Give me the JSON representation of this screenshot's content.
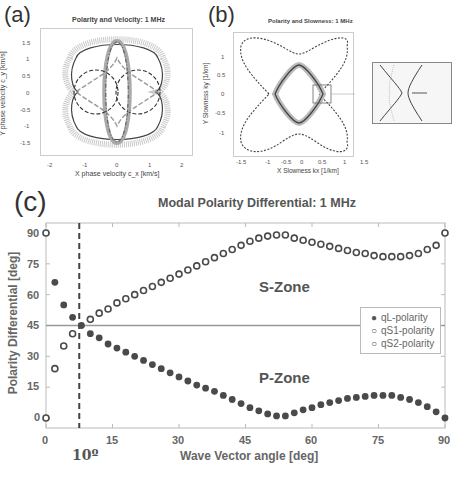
{
  "panel_a": {
    "label": "(a)",
    "title": "Polarity and Velocity: 1 MHz",
    "xlabel": "X phase velocity c_x [km/s]",
    "ylabel": "Y phase velocity c_y [km/s]",
    "xticks": [
      "-2",
      "-1",
      "0",
      "1",
      "2"
    ],
    "yticks": [
      "1.5",
      "1",
      "0.5",
      "0",
      "-0.5",
      "-1",
      "-1.5"
    ]
  },
  "panel_b": {
    "label": "(b)",
    "title": "Polarity and Slowness: 1 MHz",
    "xlabel": "X Slowness kx [1/km]",
    "ylabel": "Y Slowness ky [1/km]",
    "xticks": [
      "-1.5",
      "-1",
      "-0.5",
      "0",
      "0.5",
      "1",
      "1.5"
    ],
    "yticks": [
      "1",
      "0.5",
      "0",
      "-0.5",
      "-1"
    ],
    "inset_xticks": [
      "0.8",
      "0.9",
      "1",
      "1.1"
    ]
  },
  "panel_c": {
    "label": "(c)",
    "annotation_angle": "10º",
    "zone_s": "S-Zone",
    "zone_p": "P-Zone"
  },
  "chart_data": [
    {
      "type": "line",
      "title": "Polarity and Velocity: 1 MHz",
      "xlabel": "X phase velocity c_x [km/s]",
      "ylabel": "Y phase velocity c_y [km/s]",
      "xlim": [
        -2.3,
        2.3
      ],
      "ylim": [
        -1.8,
        1.8
      ],
      "series": [
        {
          "name": "qL velocity (solid)",
          "description": "peanut-shaped outer curve, max |cy|≈1.55, |cx|≈1.2"
        },
        {
          "name": "qS1 velocity (dash-dot)",
          "description": "vertical lobes reaching |cy|≈1.2"
        },
        {
          "name": "qS2 velocity (dashed)",
          "description": "two circles centered at cx=±0.6, radius≈0.6"
        }
      ],
      "grid": false
    },
    {
      "type": "line",
      "title": "Polarity and Slowness: 1 MHz",
      "xlabel": "X Slowness kx [1/km]",
      "ylabel": "Y Slowness ky [1/km]",
      "xlim": [
        -1.6,
        1.6
      ],
      "ylim": [
        -1.4,
        1.4
      ],
      "series": [
        {
          "name": "qL slowness",
          "description": "inner rounded diamond |kx|≈0.85, |ky|≈0.65"
        },
        {
          "name": "qS slowness",
          "description": "X-shaped four-lobe curve reaching ±1.5"
        }
      ],
      "inset": {
        "xlim": [
          0.75,
          1.15
        ],
        "description": "zoom of cusp region near kx≈0.95"
      },
      "grid": false
    },
    {
      "type": "scatter",
      "title": "Modal Polarity Differential: 1 MHz",
      "xlabel": "Wave Vector angle [deg]",
      "ylabel": "Polarity Differential [deg]",
      "xlim": [
        0,
        90
      ],
      "ylim": [
        -5,
        95
      ],
      "xticks": [
        0,
        15,
        30,
        45,
        60,
        75,
        90
      ],
      "yticks": [
        0,
        15,
        30,
        45,
        60,
        75,
        90
      ],
      "reference_lines": [
        {
          "type": "horizontal",
          "y": 45,
          "style": "solid"
        },
        {
          "type": "vertical",
          "x": 7.5,
          "style": "dashed",
          "label": "10º"
        }
      ],
      "legend": [
        "qL-polarity",
        "qS1-polarity",
        "qS2-polarity"
      ],
      "legend_position": "right-center",
      "x": [
        0,
        2,
        4,
        6,
        8,
        10,
        12,
        14,
        16,
        18,
        20,
        22,
        24,
        26,
        28,
        30,
        32,
        34,
        36,
        38,
        40,
        42,
        44,
        46,
        48,
        50,
        52,
        54,
        56,
        58,
        60,
        62,
        64,
        66,
        68,
        70,
        72,
        74,
        76,
        78,
        80,
        82,
        84,
        86,
        88,
        90
      ],
      "series": [
        {
          "name": "qL-polarity",
          "marker": "filled",
          "values": [
            null,
            66,
            55,
            49,
            45,
            41,
            39,
            36,
            34,
            32,
            30,
            28,
            26,
            24,
            22,
            20,
            18,
            16,
            14.5,
            13,
            11,
            9,
            7,
            5,
            3.5,
            2,
            1,
            1,
            2.5,
            4,
            5,
            6.5,
            7.5,
            8.5,
            9.5,
            10,
            10.5,
            11,
            11,
            11,
            10,
            9,
            7.5,
            5.5,
            3,
            0
          ]
        },
        {
          "name": "qS1-polarity",
          "marker": "open",
          "values": [
            90,
            24,
            35,
            41,
            null,
            48,
            51,
            53,
            56,
            58,
            60,
            62,
            64,
            66,
            68,
            70,
            72,
            74,
            76,
            78,
            80,
            82,
            84,
            86,
            87.5,
            88.5,
            89,
            89,
            87.5,
            86.5,
            85.5,
            84.5,
            83.5,
            82.5,
            81.5,
            80.5,
            80,
            79,
            78.5,
            78.5,
            78.5,
            79,
            80,
            82,
            84,
            90
          ]
        },
        {
          "name": "qS2-polarity",
          "marker": "open",
          "values": [
            0,
            null,
            null,
            null,
            null,
            null,
            null,
            null,
            null,
            null,
            null,
            null,
            null,
            null,
            null,
            null,
            null,
            null,
            null,
            null,
            null,
            null,
            null,
            null,
            null,
            null,
            null,
            null,
            null,
            null,
            null,
            null,
            null,
            null,
            null,
            null,
            null,
            null,
            null,
            null,
            null,
            null,
            null,
            null,
            null,
            null
          ]
        }
      ],
      "annotations": [
        "S-Zone",
        "P-Zone",
        "10º"
      ]
    }
  ],
  "chart_c_labels": {
    "title": "Modal Polarity Differential: 1 MHz",
    "xlabel": "Wave Vector angle [deg]",
    "ylabel": "Polarity Differential [deg]",
    "xticks": [
      "0",
      "15",
      "30",
      "45",
      "60",
      "75",
      "90"
    ],
    "yticks": [
      "90",
      "75",
      "60",
      "45",
      "30",
      "15",
      "0"
    ],
    "legend": [
      {
        "label": "qL-polarity",
        "symbol": "●"
      },
      {
        "label": "qS1-polarity",
        "symbol": "○"
      },
      {
        "label": "qS2-polarity",
        "symbol": "○"
      }
    ]
  }
}
